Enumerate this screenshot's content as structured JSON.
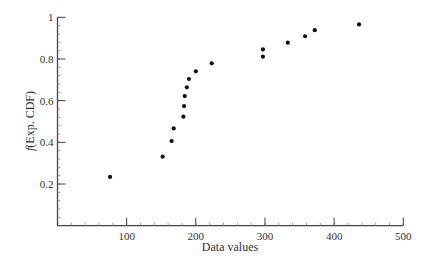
{
  "chart_data": {
    "type": "scatter",
    "title": "",
    "xlabel": "Data values",
    "ylabel_prefix": "f",
    "ylabel_rest": "(Exp. CDF)",
    "ylabel": "f(Exp. CDF)",
    "xlim": [
      0,
      500
    ],
    "ylim": [
      0,
      1
    ],
    "x_ticks": [
      100,
      200,
      300,
      400,
      500
    ],
    "x_tick_labels": [
      "100",
      "200",
      "300",
      "400",
      "500"
    ],
    "x_minor_step": 20,
    "y_ticks": [
      0.2,
      0.4,
      0.6,
      0.8,
      1
    ],
    "y_tick_labels": [
      "0.2",
      "0.4",
      "0.6",
      "0.8",
      "1"
    ],
    "y_minor_step": 0.04,
    "grid": false,
    "legend": null,
    "marker_color": "#111111",
    "axis_color": "#444444",
    "series": [
      {
        "name": "Exp. CDF",
        "points": [
          {
            "x": 76,
            "y": 0.234
          },
          {
            "x": 152,
            "y": 0.331
          },
          {
            "x": 165,
            "y": 0.406
          },
          {
            "x": 168,
            "y": 0.467
          },
          {
            "x": 182,
            "y": 0.523
          },
          {
            "x": 183,
            "y": 0.574
          },
          {
            "x": 184,
            "y": 0.622
          },
          {
            "x": 187,
            "y": 0.664
          },
          {
            "x": 190,
            "y": 0.704
          },
          {
            "x": 200,
            "y": 0.741
          },
          {
            "x": 223,
            "y": 0.779
          },
          {
            "x": 297,
            "y": 0.811
          },
          {
            "x": 297,
            "y": 0.846
          },
          {
            "x": 333,
            "y": 0.878
          },
          {
            "x": 358,
            "y": 0.909
          },
          {
            "x": 372,
            "y": 0.938
          },
          {
            "x": 436,
            "y": 0.966
          }
        ]
      }
    ]
  }
}
